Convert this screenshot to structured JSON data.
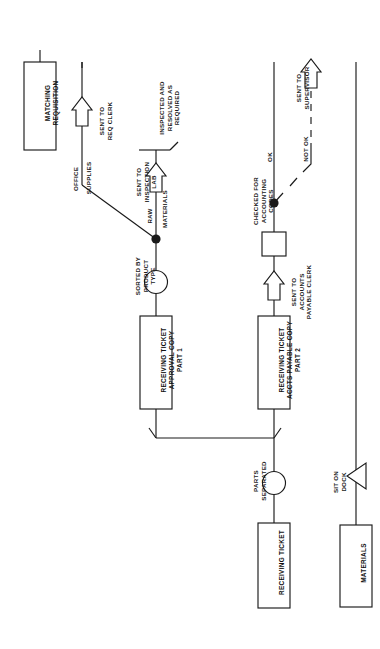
{
  "diagram": {
    "orientation": "rotated-90-ccw",
    "stroke_color": "#1a1a1a",
    "fill_color": "#ffffff",
    "boxes": [
      {
        "id": "matching-requisition",
        "label": "MATCHING\nREQUISITION"
      },
      {
        "id": "receiving-ticket-approval-copy",
        "label": "RECEIVING TICKET\nAPPROVAL COPY\nPART 1"
      },
      {
        "id": "receiving-ticket-accts-payable-copy",
        "label": "RECEIVING TICKET\nACCTS PAYABLE COPY\nPART 2"
      },
      {
        "id": "receiving-ticket",
        "label": "RECEIVING TICKET"
      },
      {
        "id": "materials",
        "label": "MATERIALS"
      }
    ],
    "operations": [
      {
        "id": "checked-for-accounting-codes",
        "shape": "square",
        "label": "CHECKED FOR\nACCOUNTING\nCODES"
      },
      {
        "id": "sorted-by-product-type",
        "shape": "circle",
        "label": "SORTED BY\nPRODUCT\nTYPE"
      },
      {
        "id": "parts-separated",
        "shape": "circle",
        "label": "PARTS\nSEPARATED"
      }
    ],
    "transports": [
      {
        "id": "sent-to-req-clerk",
        "shape": "open-arrow",
        "label": "SENT TO\nREQ CLERK"
      },
      {
        "id": "sent-to-inspection-lab",
        "shape": "open-arrow",
        "label": "SENT TO\nINSPECTION\nLAB"
      },
      {
        "id": "sent-to-accounts-payable-clerk",
        "shape": "open-arrow",
        "label": "SENT TO\nACCOUNTS\nPAYABLE CLERK"
      },
      {
        "id": "sent-to-supervisor",
        "shape": "open-arrow",
        "label": "SENT TO\nSUPERVISOR"
      },
      {
        "id": "sit-on-dock",
        "shape": "triangle",
        "label": "SIT ON\nDOCK"
      }
    ],
    "flow_labels": [
      {
        "id": "office-supplies",
        "label": "OFFICE"
      },
      {
        "id": "office-supplies-2",
        "label": "SUPPLIES"
      },
      {
        "id": "raw-materials",
        "label": "RAW"
      },
      {
        "id": "raw-materials-2",
        "label": "MATERIALS"
      },
      {
        "id": "ok-branch",
        "label": "OK"
      },
      {
        "id": "not-ok-branch",
        "label": "NOT OK"
      }
    ],
    "terminators": [
      {
        "id": "inspected-and-resolved",
        "label": "INSPECTED AND\nRESOLVED AS\nREQUIRED"
      }
    ]
  }
}
